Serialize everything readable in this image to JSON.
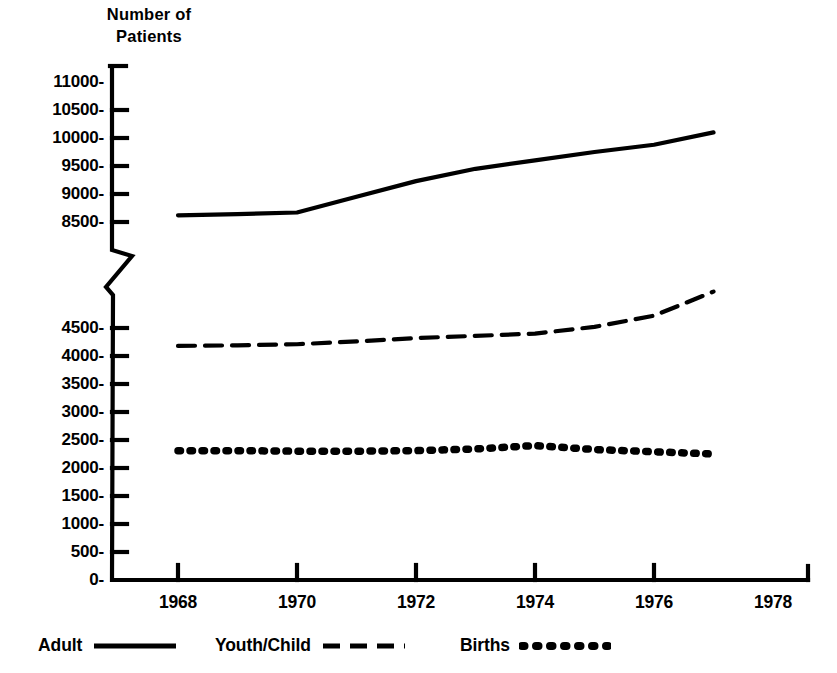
{
  "chart_data": {
    "type": "line",
    "title": "",
    "ylabel": "Number of\nPatients",
    "xlabel": "",
    "xlim": [
      1967,
      1978
    ],
    "ylim": [
      0,
      11000
    ],
    "grid": false,
    "axis_break": {
      "present": true,
      "lower_segment_range": [
        0,
        4750
      ],
      "upper_segment_range": [
        8250,
        11000
      ],
      "note": "y-axis broken between 4750 and 8250"
    },
    "x_tick_labels": [
      "1968",
      "1970",
      "1972",
      "1974",
      "1976",
      "1978"
    ],
    "x_tick_values": [
      1968,
      1970,
      1972,
      1974,
      1976,
      1978
    ],
    "y_tick_labels": [
      "11000-",
      "10500-",
      "10000-",
      "9500-",
      "9000-",
      "8500-",
      "4500-",
      "4000-",
      "3500-",
      "3000-",
      "2500-",
      "2000-",
      "1500-",
      "1000-",
      "500-",
      "0-"
    ],
    "y_tick_values": [
      11000,
      10500,
      10000,
      9500,
      9000,
      8500,
      4500,
      4000,
      3500,
      3000,
      2500,
      2000,
      1500,
      1000,
      500,
      0
    ],
    "legend_position": "bottom",
    "x": [
      1968,
      1969,
      1970,
      1971,
      1972,
      1973,
      1974,
      1975,
      1976,
      1977
    ],
    "series": [
      {
        "name": "Adult",
        "style": "solid",
        "color": "#000000",
        "values": [
          8620,
          8640,
          8670,
          8950,
          9230,
          9450,
          9600,
          9750,
          9880,
          10100
        ]
      },
      {
        "name": "Youth/Child",
        "style": "dashed",
        "color": "#000000",
        "values": [
          4180,
          4190,
          4210,
          4260,
          4320,
          4360,
          4400,
          4520,
          4720,
          5150
        ]
      },
      {
        "name": "Births",
        "style": "dotted",
        "color": "#000000",
        "values": [
          2310,
          2310,
          2300,
          2300,
          2310,
          2340,
          2400,
          2330,
          2290,
          2250
        ]
      }
    ]
  },
  "axis": {
    "y_title": "Number of\nPatients"
  },
  "legend": {
    "entries": [
      {
        "label": "Adult",
        "style": "solid"
      },
      {
        "label": "Youth/Child",
        "style": "dashed"
      },
      {
        "label": "Births",
        "style": "dotted"
      }
    ]
  }
}
